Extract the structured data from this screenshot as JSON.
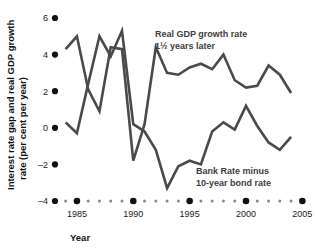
{
  "chart_data": {
    "type": "line",
    "title": "",
    "xlabel": "Year",
    "ylabel": "Interest rate gap and real GDP growth rate (per cent per year)",
    "ylabel_line1": "Interest rate gap and real GDP growth",
    "ylabel_line2": "rate (per cent per year)",
    "xlim": [
      1983.5,
      2005.5
    ],
    "ylim": [
      -4,
      6
    ],
    "yticks": [
      6,
      4,
      2,
      0,
      -2,
      -4
    ],
    "ytick_labels": [
      "6",
      "4",
      "2",
      "0",
      "–2",
      "–4"
    ],
    "xticks": [
      1985,
      1990,
      1995,
      2000,
      2005
    ],
    "xtick_labels": [
      "1985",
      "1990",
      "1995",
      "2000",
      "2005"
    ],
    "xticks_minor": [
      1984,
      1986,
      1987,
      1988,
      1989,
      1991,
      1992,
      1993,
      1994,
      1996,
      1997,
      1998,
      1999,
      2001,
      2002,
      2003,
      2004
    ],
    "grid": false,
    "legend_position": "inline-annotations",
    "line_color": "#4a4a4a",
    "tick_color": "#111111",
    "series": [
      {
        "name": "Real GDP growth rate 1½ years later",
        "label_line1": "Real GDP growth rate",
        "label_line2": "1½ years later",
        "color": "#4a4a4a",
        "x": [
          1984,
          1985,
          1986,
          1987,
          1988,
          1989,
          1990,
          1991,
          1992,
          1993,
          1994,
          1995,
          1996,
          1997,
          1998,
          1999,
          2000,
          2001,
          2002,
          2003,
          2004
        ],
        "values": [
          4.3,
          5.0,
          2.1,
          0.9,
          4.4,
          4.3,
          -1.8,
          0.2,
          4.4,
          3.0,
          2.9,
          3.3,
          3.5,
          3.2,
          4.0,
          2.6,
          2.2,
          2.3,
          3.4,
          2.9,
          1.9
        ]
      },
      {
        "name": "Bank Rate minus 10-year bond rate",
        "label_line1": "Bank Rate minus",
        "label_line2": "10-year bond rate",
        "color": "#4a4a4a",
        "x": [
          1984,
          1985,
          1986,
          1987,
          1988,
          1989,
          1990,
          1991,
          1992,
          1993,
          1994,
          1995,
          1996,
          1997,
          1998,
          1999,
          2000,
          2001,
          2002,
          2003,
          2004
        ],
        "values": [
          0.3,
          -0.3,
          2.4,
          5.0,
          3.9,
          5.3,
          0.2,
          -0.2,
          -1.2,
          -3.3,
          -2.1,
          -1.8,
          -2.0,
          -0.2,
          0.3,
          -0.1,
          1.2,
          0.1,
          -0.8,
          -1.2,
          -0.5
        ]
      }
    ],
    "annotations": [
      {
        "text": "Real GDP growth rate 1½ years later",
        "series": "gdp"
      },
      {
        "text": "Bank Rate minus 10-year bond rate",
        "series": "gap"
      }
    ]
  }
}
